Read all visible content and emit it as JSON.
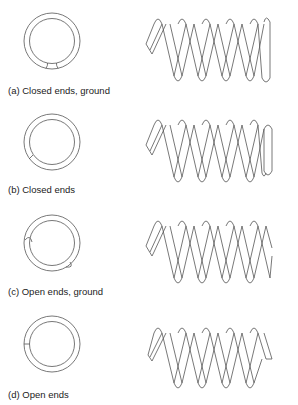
{
  "figure": {
    "panels": [
      {
        "id": "a",
        "caption": "(a) Closed ends, ground",
        "end_type": "closed-ground"
      },
      {
        "id": "b",
        "caption": "(b) Closed ends",
        "end_type": "closed"
      },
      {
        "id": "c",
        "caption": "(c) Open ends, ground",
        "end_type": "open-ground"
      },
      {
        "id": "d",
        "caption": "(d) Open ends",
        "end_type": "open"
      }
    ],
    "colors": {
      "line": "#555555",
      "background": "#ffffff"
    }
  }
}
